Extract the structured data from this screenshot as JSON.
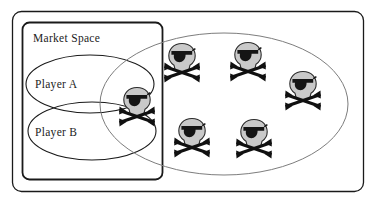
{
  "figure": {
    "width": 376,
    "height": 208,
    "background_color": "#ffffff"
  },
  "labels": {
    "market_space": "Market Space",
    "player_a": "Player A",
    "player_b": "Player B"
  },
  "colors": {
    "outer_frame_stroke": "#1a1a1a",
    "inner_frame_stroke": "#1a1a1a",
    "player_ellipse_stroke": "#1a1a1a",
    "market_ellipse_stroke": "#7d7d7d",
    "skull_fill": "#c9c9c9",
    "skull_outline": "#2b2b2b",
    "eyepatch_fill": "#151515",
    "bone_fill": "#101010"
  },
  "shapes": {
    "outer_frame": {
      "x": 12,
      "y": 11,
      "width": 352,
      "height": 181,
      "rx": 9
    },
    "inner_frame": {
      "x": 22,
      "y": 22,
      "width": 141,
      "height": 158,
      "rx": 7
    },
    "player_a_ellipse": {
      "cx": 90,
      "cy": 84,
      "rx": 64,
      "ry": 29
    },
    "player_b_ellipse": {
      "cx": 92,
      "cy": 131,
      "rx": 64,
      "ry": 29
    },
    "market_ellipse": {
      "cx": 224,
      "cy": 104,
      "rx": 124,
      "ry": 71
    }
  },
  "icons": [
    {
      "name": "pirate-icon-overlap",
      "x": 137,
      "y": 104,
      "scale": 1.0,
      "region": "player-a-player-b-overlap"
    },
    {
      "name": "pirate-icon-1",
      "x": 182,
      "y": 60,
      "scale": 1.0,
      "region": "market-ellipse"
    },
    {
      "name": "pirate-icon-2",
      "x": 248,
      "y": 59,
      "scale": 1.0,
      "region": "market-ellipse"
    },
    {
      "name": "pirate-icon-3",
      "x": 303,
      "y": 88,
      "scale": 1.0,
      "region": "market-ellipse"
    },
    {
      "name": "pirate-icon-4",
      "x": 192,
      "y": 135,
      "scale": 1.0,
      "region": "market-ellipse"
    },
    {
      "name": "pirate-icon-5",
      "x": 254,
      "y": 136,
      "scale": 1.0,
      "region": "market-ellipse"
    }
  ],
  "label_positions": {
    "market_space": {
      "x": 33,
      "y": 42
    },
    "player_a": {
      "x": 35,
      "y": 88
    },
    "player_b": {
      "x": 35,
      "y": 136
    }
  }
}
